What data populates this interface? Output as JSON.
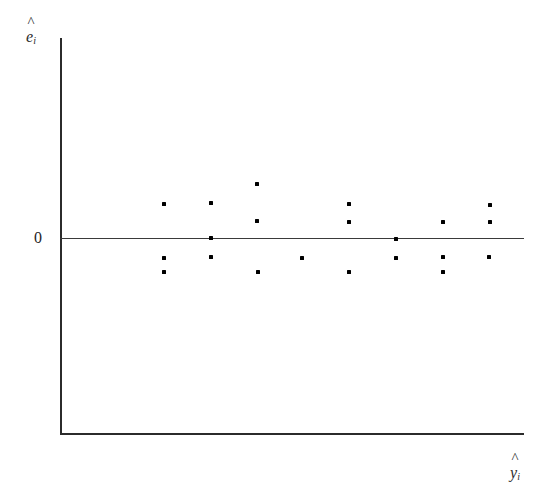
{
  "figure": {
    "width": 548,
    "height": 490,
    "background": "#ffffff",
    "axis_color": "#2b2b2b",
    "point_color": "#000000"
  },
  "labels": {
    "y_axis_hat": "^",
    "y_axis_symbol": "e",
    "y_axis_subscript": "i",
    "x_axis_hat": "^",
    "x_axis_symbol": "y",
    "x_axis_subscript": "i",
    "zero_tick": "0"
  },
  "chart_data": {
    "type": "scatter",
    "title": "",
    "xlabel": "y-hat_i",
    "ylabel": "e-hat_i",
    "grid": false,
    "legend": null,
    "annotations": [
      {
        "text": "0",
        "axis": "y",
        "value": 0
      }
    ],
    "reference_lines": [
      {
        "orientation": "horizontal",
        "y": 0,
        "label": "zero residual line"
      }
    ],
    "axis_pixel_frame": {
      "x_axis_y_px": 434,
      "y_axis_x_px": 61,
      "zero_line_y_px": 239,
      "plot_right_px": 524,
      "plot_top_px": 38
    },
    "note": "Residuals scattered randomly about zero with roughly constant spread (homoscedastic pattern).",
    "x": [
      164,
      211,
      211,
      164,
      164,
      257,
      257,
      258,
      302,
      349,
      349,
      349,
      396,
      396,
      443,
      443,
      443,
      489,
      490,
      490,
      211
    ],
    "y_pixel": [
      204,
      203,
      257,
      258,
      272,
      184,
      221,
      272,
      258,
      204,
      222,
      272,
      239,
      258,
      222,
      257,
      272,
      257,
      205,
      222,
      238
    ],
    "points": [
      {
        "x_px": 164,
        "y_px": 204,
        "residual": 0.4
      },
      {
        "x_px": 164,
        "y_px": 258,
        "residual": -0.21
      },
      {
        "x_px": 164,
        "y_px": 272,
        "residual": -0.37
      },
      {
        "x_px": 211,
        "y_px": 203,
        "residual": 0.41
      },
      {
        "x_px": 211,
        "y_px": 238,
        "residual": 0.01
      },
      {
        "x_px": 211,
        "y_px": 257,
        "residual": -0.2
      },
      {
        "x_px": 257,
        "y_px": 184,
        "residual": 0.62
      },
      {
        "x_px": 257,
        "y_px": 221,
        "residual": 0.2
      },
      {
        "x_px": 258,
        "y_px": 272,
        "residual": -0.37
      },
      {
        "x_px": 302,
        "y_px": 258,
        "residual": -0.21
      },
      {
        "x_px": 349,
        "y_px": 204,
        "residual": 0.4
      },
      {
        "x_px": 349,
        "y_px": 222,
        "residual": 0.19
      },
      {
        "x_px": 349,
        "y_px": 272,
        "residual": -0.37
      },
      {
        "x_px": 396,
        "y_px": 239,
        "residual": 0.0
      },
      {
        "x_px": 396,
        "y_px": 258,
        "residual": -0.21
      },
      {
        "x_px": 443,
        "y_px": 222,
        "residual": 0.19
      },
      {
        "x_px": 443,
        "y_px": 257,
        "residual": -0.2
      },
      {
        "x_px": 443,
        "y_px": 272,
        "residual": -0.37
      },
      {
        "x_px": 489,
        "y_px": 257,
        "residual": -0.2
      },
      {
        "x_px": 490,
        "y_px": 205,
        "residual": 0.38
      },
      {
        "x_px": 490,
        "y_px": 222,
        "residual": 0.19
      }
    ]
  }
}
